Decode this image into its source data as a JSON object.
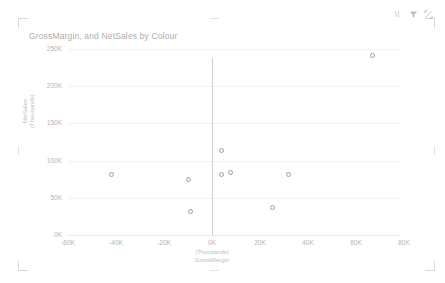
{
  "visual": {
    "title": "GrossMargin, and NetSales by Colour",
    "background": "#ffffff",
    "marker_color": "#9c9c9c",
    "text_color": "#b4b4b4",
    "zero_line_color": "#cfcfcf"
  },
  "header": {
    "icons": [
      {
        "name": "drill-down-icon",
        "label": "Drill down"
      },
      {
        "name": "filter-icon",
        "label": "Filters"
      },
      {
        "name": "focus-mode-icon",
        "label": "Focus mode"
      }
    ]
  },
  "chart_data": {
    "type": "scatter",
    "title": "GrossMargin, and NetSales by Colour",
    "xlabel": "GrossMargin",
    "xlabel_units": "(Thousands)",
    "ylabel": "NetSales",
    "ylabel_units": "(Thousands)",
    "xlim": [
      -60000,
      80000
    ],
    "ylim": [
      0,
      250000
    ],
    "xticks": [
      "-60K",
      "-40K",
      "-20K",
      "0K",
      "20K",
      "40K",
      "60K",
      "80K"
    ],
    "xtick_values": [
      -60000,
      -40000,
      -20000,
      0,
      20000,
      40000,
      60000,
      80000
    ],
    "yticks": [
      "0K",
      "50K",
      "100K",
      "150K",
      "200K",
      "250K"
    ],
    "ytick_values": [
      0,
      50000,
      100000,
      150000,
      200000,
      250000
    ],
    "grid": true,
    "legend": null,
    "legend_field": "Colour",
    "marker_style": "hollow-circle",
    "points": [
      {
        "x": -42000,
        "y": 81000
      },
      {
        "x": -10000,
        "y": 74000
      },
      {
        "x": -9000,
        "y": 31000
      },
      {
        "x": 4000,
        "y": 114000
      },
      {
        "x": 4000,
        "y": 81000
      },
      {
        "x": 7500,
        "y": 84000
      },
      {
        "x": 25000,
        "y": 37000
      },
      {
        "x": 32000,
        "y": 81000
      },
      {
        "x": 67000,
        "y": 242000
      }
    ]
  }
}
